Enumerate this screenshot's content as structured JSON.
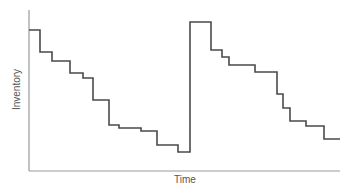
{
  "chart_data": {
    "type": "line",
    "subtype": "step",
    "title": "",
    "xlabel": "Time",
    "ylabel": "Inventory",
    "grid": false,
    "legend": null,
    "ticks": "none",
    "colors": {
      "line": "#4a4a4a",
      "axis": "#9a9a9a",
      "label": "#555555"
    },
    "points_px": [
      [
        29,
        30
      ],
      [
        40,
        30
      ],
      [
        40,
        52
      ],
      [
        52,
        52
      ],
      [
        52,
        61
      ],
      [
        70,
        61
      ],
      [
        70,
        73
      ],
      [
        83,
        73
      ],
      [
        83,
        78
      ],
      [
        93,
        78
      ],
      [
        93,
        100
      ],
      [
        109,
        100
      ],
      [
        109,
        125
      ],
      [
        119,
        125
      ],
      [
        119,
        128
      ],
      [
        141,
        128
      ],
      [
        141,
        131
      ],
      [
        157,
        131
      ],
      [
        157,
        145
      ],
      [
        178,
        145
      ],
      [
        178,
        152
      ],
      [
        190,
        152
      ],
      [
        190,
        22
      ],
      [
        211,
        22
      ],
      [
        211,
        50
      ],
      [
        222,
        50
      ],
      [
        222,
        57
      ],
      [
        229,
        57
      ],
      [
        229,
        65
      ],
      [
        255,
        65
      ],
      [
        255,
        72
      ],
      [
        277,
        72
      ],
      [
        277,
        94
      ],
      [
        283,
        94
      ],
      [
        283,
        108
      ],
      [
        290,
        108
      ],
      [
        290,
        121
      ],
      [
        306,
        121
      ],
      [
        306,
        126
      ],
      [
        324,
        126
      ],
      [
        324,
        139
      ],
      [
        340,
        139
      ]
    ],
    "axes_px": {
      "origin": [
        29,
        171
      ],
      "x_end": 340,
      "y_top": 10
    }
  },
  "labels": {
    "x": "Time",
    "y": "Inventory"
  }
}
